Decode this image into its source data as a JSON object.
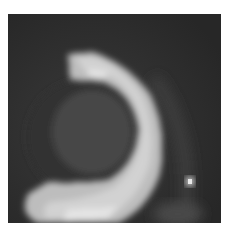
{
  "image": {
    "kind": "grayscale scan crop",
    "description": "Pixelated grayscale image showing a bright curved arc (crescent) wrapping around a dark circular region, with a small bright spot at lower right",
    "colors": {
      "background": "#ffffff",
      "dark_field": "#2b2b2b",
      "dark_disc": "#3a3a3a",
      "disc_inner": "#454545",
      "bright_arc": "#c8c8c8",
      "bright_highlight": "#e0e0e0",
      "spot": "#d8d8d8"
    }
  }
}
